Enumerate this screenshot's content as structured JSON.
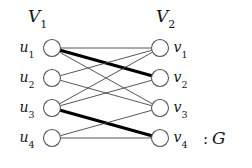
{
  "figure": {
    "caption_tail": ": G",
    "tail_colon": ":",
    "tail_graph_name": "G",
    "background_color": "#ffffff",
    "line_color": "#444444",
    "thick_line_color": "#000000",
    "node_fill": "#ffffff",
    "node_stroke": "#555555"
  },
  "sets": {
    "left": {
      "name": "V",
      "subscript": "1",
      "label": "V1"
    },
    "right": {
      "name": "V",
      "subscript": "2",
      "label": "V2"
    }
  },
  "left_nodes": [
    {
      "id": "u1",
      "name": "u",
      "subscript": "1",
      "cx": 52,
      "cy": 48,
      "r": 8.5
    },
    {
      "id": "u2",
      "name": "u",
      "subscript": "2",
      "cx": 52,
      "cy": 78,
      "r": 8.5
    },
    {
      "id": "u3",
      "name": "u",
      "subscript": "3",
      "cx": 52,
      "cy": 108,
      "r": 8.5
    },
    {
      "id": "u4",
      "name": "u",
      "subscript": "4",
      "cx": 52,
      "cy": 138,
      "r": 8.5
    }
  ],
  "right_nodes": [
    {
      "id": "v1",
      "name": "v",
      "subscript": "1",
      "cx": 160,
      "cy": 48,
      "r": 8.5
    },
    {
      "id": "v2",
      "name": "v",
      "subscript": "2",
      "cx": 160,
      "cy": 78,
      "r": 8.5
    },
    {
      "id": "v3",
      "name": "v",
      "subscript": "3",
      "cx": 160,
      "cy": 108,
      "r": 8.5
    },
    {
      "id": "v4",
      "name": "v",
      "subscript": "4",
      "cx": 160,
      "cy": 138,
      "r": 8.5
    }
  ],
  "edges": [
    {
      "from": "u1",
      "to": "v1",
      "weight": "thin"
    },
    {
      "from": "u1",
      "to": "v3",
      "weight": "thin"
    },
    {
      "from": "u1",
      "to": "v2",
      "weight": "thick"
    },
    {
      "from": "u2",
      "to": "v1",
      "weight": "thin"
    },
    {
      "from": "u2",
      "to": "v3",
      "weight": "thin"
    },
    {
      "from": "u3",
      "to": "v1",
      "weight": "thin"
    },
    {
      "from": "u3",
      "to": "v2",
      "weight": "thin"
    },
    {
      "from": "u3",
      "to": "v4",
      "weight": "thick"
    },
    {
      "from": "u4",
      "to": "v3",
      "weight": "thin"
    },
    {
      "from": "u4",
      "to": "v4",
      "weight": "thin"
    }
  ],
  "graph_meta": {
    "type": "bipartite-graph",
    "thick_edges_meaning": "matching",
    "thin_stroke_width": 0.9,
    "thick_stroke_width": 3.2
  }
}
